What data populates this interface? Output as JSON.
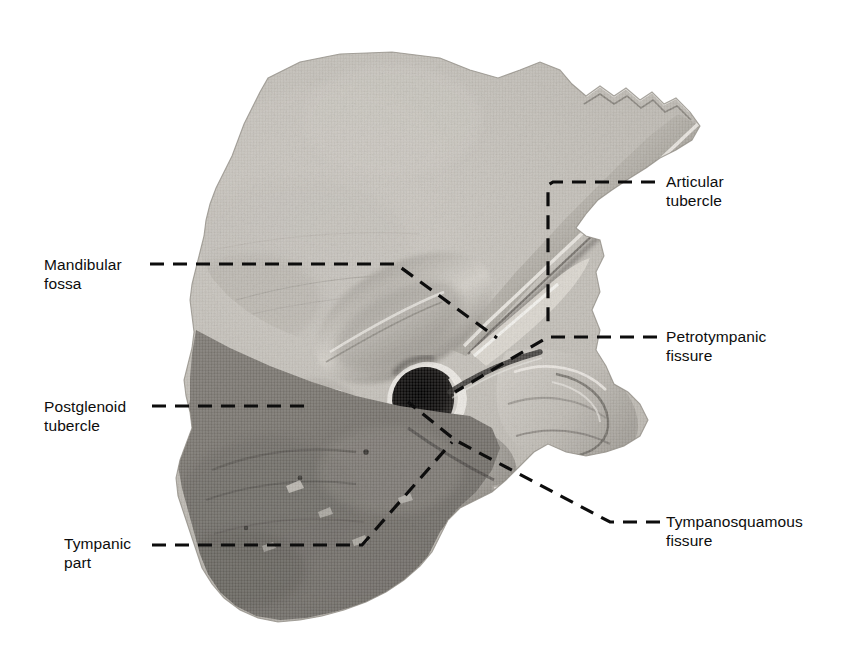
{
  "figure": {
    "kind": "anatomical-halftone-photograph",
    "background_color": "#ffffff",
    "ink_color": "#0d0d0d",
    "width": 863,
    "height": 670
  },
  "labels": [
    {
      "id": "articular-tubercle",
      "text": "Articular\ntubercle",
      "side": "right",
      "x": 666,
      "y": 172
    },
    {
      "id": "petrotympanic-fissure",
      "text": "Petrotympanic\nfissure",
      "side": "right",
      "x": 666,
      "y": 327
    },
    {
      "id": "tympanosquamous-fissure",
      "text": "Tympanosquamous\nfissure",
      "side": "right",
      "x": 666,
      "y": 512
    },
    {
      "id": "mandibular-fossa",
      "text": "Mandibular\nfossa",
      "side": "left",
      "x": 44,
      "y": 255
    },
    {
      "id": "postglenoid-tubercle",
      "text": "Postglenoid\ntubercle",
      "side": "left",
      "x": 44,
      "y": 397
    },
    {
      "id": "tympanic-part",
      "text": "Tympanic\npart",
      "side": "left",
      "x": 64,
      "y": 534
    }
  ],
  "leader_lines": [
    {
      "id": "articular-tubercle-leader",
      "for": "articular-tubercle",
      "points": "655,182 553,182 548,185 548,330",
      "dash": "14,9"
    },
    {
      "id": "petrotympanic-fissure-leader",
      "for": "petrotympanic-fissure",
      "points": "657,337 548,337 455,392",
      "dash": "14,9"
    },
    {
      "id": "tympanosquamous-fissure-leader",
      "for": "tympanosquamous-fissure",
      "points": "660,522 610,522 455,440 408,402",
      "dash": "14,9"
    },
    {
      "id": "mandibular-fossa-leader",
      "for": "mandibular-fossa",
      "points": "150,264 396,264 497,338",
      "dash": "14,9"
    },
    {
      "id": "postglenoid-tubercle-leader",
      "for": "postglenoid-tubercle",
      "points": "152,406 306,406",
      "dash": "14,9"
    },
    {
      "id": "tympanic-part-leader",
      "for": "tympanic-part",
      "points": "152,545 362,545 452,442",
      "dash": "14,9"
    }
  ],
  "specimen": {
    "regions": [
      {
        "id": "squamous-part",
        "tone": "#b9b6b0"
      },
      {
        "id": "zygomatic-process",
        "tone": "#9c9892"
      },
      {
        "id": "mandibular-fossa-floor",
        "tone": "#cfcbc4"
      },
      {
        "id": "articular-tubercle-ridge",
        "tone": "#e4e1da"
      },
      {
        "id": "external-acoustic-meatus",
        "tone": "#151311"
      },
      {
        "id": "tympanic-plate",
        "tone": "#8d8982"
      },
      {
        "id": "mastoid-part",
        "tone": "#7d7a74"
      },
      {
        "id": "petrous-part",
        "tone": "#c6c2bb"
      },
      {
        "id": "styloid-region",
        "tone": "#b0aca5"
      }
    ]
  }
}
